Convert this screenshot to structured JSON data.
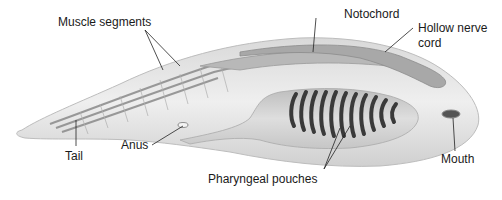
{
  "diagram": {
    "colors": {
      "body": "#e6e6e6",
      "body_edge": "#c4c4c4",
      "muscle": "#8a8a8a",
      "notochord": "#b5b5b5",
      "nerve_cord": "#9c9c9c",
      "pharynx": "#cfcfcf",
      "gill_slit": "#3a3a3a",
      "leader_line": "#222222"
    },
    "gill_slit_count": 11,
    "labels": {
      "muscle_segments": "Muscle segments",
      "notochord": "Notochord",
      "hollow_nerve_cord_line1": "Hollow nerve",
      "hollow_nerve_cord_line2": "cord",
      "tail": "Tail",
      "anus": "Anus",
      "pharyngeal_pouches": "Pharyngeal pouches",
      "mouth": "Mouth"
    }
  }
}
